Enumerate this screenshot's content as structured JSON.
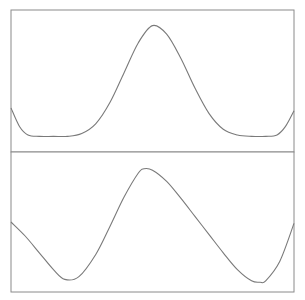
{
  "chart_data": [
    {
      "type": "line",
      "panel": "top",
      "title": "",
      "xlabel": "",
      "ylabel": "",
      "grid": false,
      "legend": null,
      "xlim": [
        0,
        1
      ],
      "ylim": [
        0,
        1
      ],
      "x": [
        0.0,
        0.03,
        0.06,
        0.1,
        0.15,
        0.2,
        0.25,
        0.3,
        0.35,
        0.4,
        0.45,
        0.5,
        0.55,
        0.6,
        0.65,
        0.7,
        0.75,
        0.8,
        0.85,
        0.9,
        0.94,
        0.97,
        1.0
      ],
      "values": [
        0.31,
        0.18,
        0.12,
        0.11,
        0.11,
        0.11,
        0.13,
        0.2,
        0.35,
        0.56,
        0.77,
        0.89,
        0.83,
        0.66,
        0.45,
        0.27,
        0.16,
        0.12,
        0.11,
        0.11,
        0.12,
        0.18,
        0.29
      ],
      "stroke": "#7a7a7a"
    },
    {
      "type": "line",
      "panel": "bottom",
      "title": "",
      "xlabel": "",
      "ylabel": "",
      "grid": false,
      "legend": null,
      "xlim": [
        0,
        1
      ],
      "ylim": [
        0,
        1
      ],
      "x": [
        0.0,
        0.05,
        0.1,
        0.15,
        0.19,
        0.24,
        0.3,
        0.35,
        0.4,
        0.45,
        0.47,
        0.5,
        0.55,
        0.6,
        0.65,
        0.7,
        0.75,
        0.8,
        0.85,
        0.88,
        0.9,
        0.95,
        1.0
      ],
      "values": [
        0.5,
        0.4,
        0.28,
        0.16,
        0.09,
        0.11,
        0.27,
        0.47,
        0.68,
        0.85,
        0.88,
        0.87,
        0.79,
        0.67,
        0.54,
        0.41,
        0.28,
        0.16,
        0.08,
        0.07,
        0.08,
        0.22,
        0.49
      ],
      "stroke": "#7a7a7a"
    }
  ],
  "frame": {
    "stroke": "#8a8a8a",
    "background": "#ffffff"
  }
}
